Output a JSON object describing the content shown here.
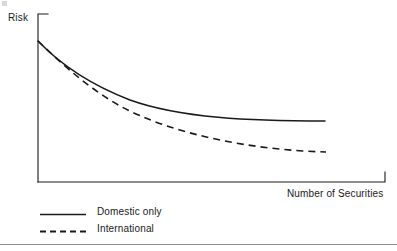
{
  "figure": {
    "title": "",
    "background_color": "#ffffff",
    "ink_color": "#1a1a1a",
    "rule_color": "#8a8a8a"
  },
  "axes": {
    "y_title": "Risk",
    "x_title": "Number of Securities",
    "y_axis_line": {
      "x": 38,
      "y_top": 14,
      "y_bottom": 182
    },
    "x_axis_line": {
      "y": 182,
      "x_left": 38,
      "x_right": 385
    },
    "y_top_tick_to_x": 48,
    "x_right_tick_to_y": 172,
    "tick_labels_x": [],
    "tick_labels_y": [],
    "grid": false
  },
  "legend": {
    "position": "below-plot-left",
    "entries": [
      {
        "label": "Domestic only",
        "style": "solid",
        "icon": "solid-line-swatch"
      },
      {
        "label": "International",
        "style": "dashed",
        "icon": "dashed-line-swatch"
      }
    ]
  },
  "chart_data": {
    "type": "line",
    "title": "",
    "subtitle": "",
    "xlabel": "Number of Securities",
    "ylabel": "Risk",
    "xlim": [
      0,
      100
    ],
    "ylim": [
      0,
      100
    ],
    "grid": false,
    "legend_position": "below-plot-left",
    "axis_tick_labels": false,
    "annotations": [],
    "x": [
      0,
      2,
      5,
      8,
      12,
      16,
      20,
      25,
      30,
      35,
      40,
      50,
      60,
      70,
      80,
      90,
      100
    ],
    "series": [
      {
        "name": "Domestic only",
        "style": "solid",
        "color": "#1a1a1a",
        "values": [
          100.0,
          86.0,
          74.0,
          66.5,
          59.5,
          54.5,
          50.8,
          47.2,
          44.4,
          42.2,
          40.4,
          37.6,
          35.6,
          34.0,
          32.8,
          31.8,
          31.0
        ]
      },
      {
        "name": "International",
        "style": "dashed",
        "color": "#1a1a1a",
        "values": [
          100.0,
          83.0,
          68.5,
          59.0,
          50.0,
          43.8,
          39.2,
          34.8,
          31.5,
          28.9,
          26.8,
          23.6,
          21.3,
          19.5,
          18.1,
          17.0,
          16.0
        ]
      }
    ],
    "pixel_paths": {
      "note": "pixel coordinates used to render the curves in figure space",
      "domestic_only": "M 38,41 C 58,62 86,83 130,100 C 180,118 250,121 325,121",
      "international": "M 38,41 C 56,58 82,84 120,106 C 172,134 250,150 326,152"
    }
  }
}
